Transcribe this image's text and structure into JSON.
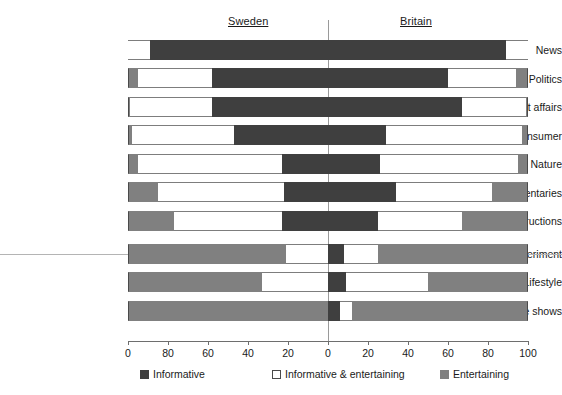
{
  "headers": {
    "left_region": "Sweden",
    "right_region": "Britain"
  },
  "legend": {
    "informative": "Informative",
    "mixed": "Informative & entertaining",
    "entertaining": "Entertaining"
  },
  "axis": {
    "tick_labels": [
      "0",
      "80",
      "60",
      "40",
      "20",
      "0",
      "20",
      "40",
      "60",
      "80",
      "100"
    ],
    "tick_values": [
      -100,
      -80,
      -60,
      -40,
      -20,
      0,
      20,
      40,
      60,
      80,
      100
    ]
  },
  "colors": {
    "informative": "#3f3f3f",
    "mixed": "#ffffff",
    "entertaining": "#808080",
    "axis": "#6e6e6e",
    "center_line": "#9a9a9a"
  },
  "categories": [
    "News",
    "Politics",
    "Current affairs",
    "Consumer",
    "Nature",
    "Documentaries",
    "Reconstructions",
    "Life experiment",
    "Lifestyle",
    "Reality game shows"
  ],
  "chart_data": {
    "type": "bar",
    "subtype": "diverging-stacked-bar",
    "title": "",
    "xlabel": "",
    "ylabel": "",
    "xlim": [
      -100,
      100
    ],
    "grid": false,
    "legend_position": "bottom",
    "note": "Back-to-back 100% stacked bars. Left half = Sweden (read right-to-left, 0 at centre to 100 at far left), right half = Britain (0 at centre to 100 at far right). Stack order outward from the centre: Informative, Informative & entertaining, Entertaining.",
    "categories": [
      "News",
      "Politics",
      "Current affairs",
      "Consumer",
      "Nature",
      "Documentaries",
      "Reconstructions",
      "Life experiment",
      "Lifestyle",
      "Reality game shows"
    ],
    "series": [
      {
        "name": "Sweden",
        "side": "left",
        "segments": [
          {
            "name": "Informative",
            "values": [
              89,
              58,
              58,
              47,
              23,
              22,
              23,
              0,
              0,
              0
            ]
          },
          {
            "name": "Informative & entertaining",
            "values": [
              11,
              37,
              41,
              51,
              72,
              63,
              54,
              21,
              33,
              0
            ]
          },
          {
            "name": "Entertaining",
            "values": [
              0,
              5,
              1,
              2,
              5,
              15,
              23,
              79,
              67,
              100
            ]
          }
        ]
      },
      {
        "name": "Britain",
        "side": "right",
        "segments": [
          {
            "name": "Informative",
            "values": [
              89,
              60,
              67,
              29,
              26,
              34,
              25,
              8,
              9,
              6
            ]
          },
          {
            "name": "Informative & entertaining",
            "values": [
              11,
              34,
              32,
              68,
              69,
              48,
              42,
              17,
              41,
              6
            ]
          },
          {
            "name": "Entertaining",
            "values": [
              0,
              6,
              1,
              3,
              5,
              18,
              33,
              75,
              50,
              88
            ]
          }
        ]
      }
    ]
  }
}
